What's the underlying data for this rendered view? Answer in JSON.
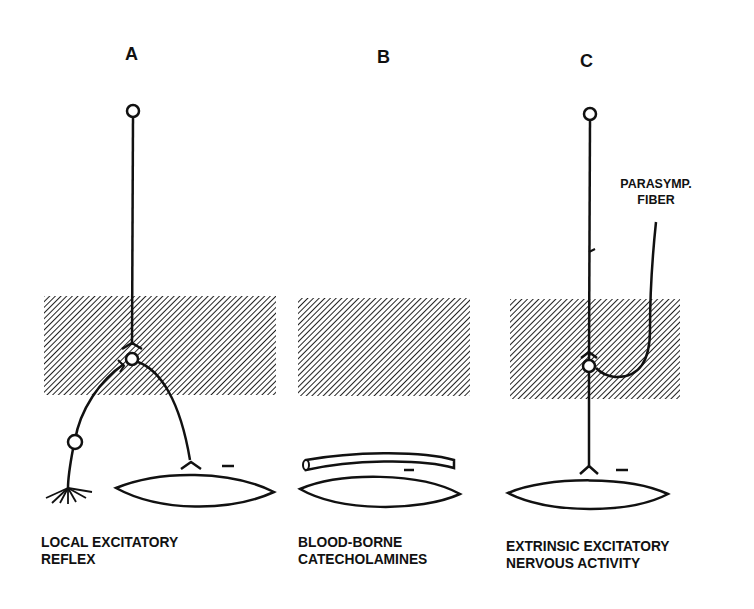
{
  "panels": [
    {
      "letter": "A",
      "caption_line1": "LOCAL EXCITATORY",
      "caption_line2": "REFLEX"
    },
    {
      "letter": "B",
      "caption_line1": "BLOOD-BORNE",
      "caption_line2": "CATECHOLAMINES"
    },
    {
      "letter": "C",
      "caption_line1": "EXTRINSIC EXCITATORY",
      "caption_line2": "NERVOUS ACTIVITY",
      "annotation_line1": "PARASYMP.",
      "annotation_line2": "FIBER"
    }
  ],
  "symbols": {
    "effect_sign": "–"
  },
  "colors": {
    "ink": "#111111",
    "background": "#ffffff",
    "hatch": "#222222"
  }
}
